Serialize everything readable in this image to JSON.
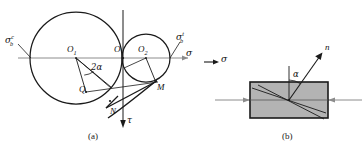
{
  "figure": {
    "panels": [
      {
        "id": "a",
        "caption": "(a)",
        "title": "mohr-circle-diagram"
      },
      {
        "id": "b",
        "caption": "(b)",
        "title": "stress-element-diagram"
      }
    ]
  },
  "panel_a": {
    "axes": {
      "sigma_label": "σ",
      "tau_label": "τ"
    },
    "points": {
      "O": "O",
      "O1": "O",
      "O1_sub": "1",
      "O2": "O",
      "O2_sub": "2",
      "Q": "Q",
      "M": "M",
      "N": "N"
    },
    "angle_label": "2α",
    "stress_left": {
      "base": "σ",
      "sub": "b",
      "sup": "c"
    },
    "stress_right": {
      "base": "σ",
      "sub": "b",
      "sup": "t"
    },
    "geometry": {
      "big_circle": {
        "cx": 76,
        "cy": 58,
        "r": 46
      },
      "small_circle": {
        "cx": 146,
        "cy": 58,
        "r": 24
      },
      "origin": {
        "x": 123,
        "y": 58
      },
      "sigma_axis_y": 58,
      "tau_axis_x": 123
    }
  },
  "panel_b": {
    "normal_label": "n",
    "angle_label": "α",
    "stress_label": "σ",
    "geometry": {
      "rect": {
        "x": 250,
        "y": 82,
        "w": 78,
        "h": 36
      },
      "center": {
        "x": 289,
        "y": 100
      },
      "normal_angle_deg": 35
    },
    "colors": {
      "fill": "#b3b3b3",
      "stroke": "#1a1a1a",
      "arrow": "#8c8c8c"
    }
  },
  "colors": {
    "ink": "#1a1a1a",
    "axis": "#8c8c8c",
    "shade": "#b3b3b3"
  }
}
